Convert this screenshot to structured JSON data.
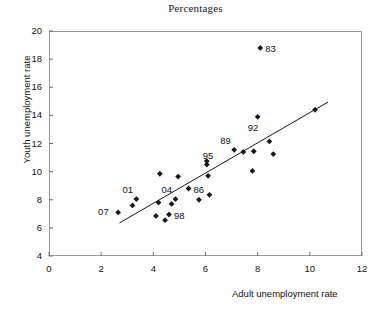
{
  "chart_data": {
    "type": "scatter",
    "title": "Percentages",
    "xlabel": "Adult unemployment rate",
    "ylabel": "Youth unemployment rate",
    "xlim": [
      0,
      12
    ],
    "ylim": [
      4,
      20
    ],
    "xticks": [
      0,
      2,
      4,
      6,
      8,
      10,
      12
    ],
    "yticks": [
      4,
      6,
      8,
      10,
      12,
      14,
      16,
      18,
      20
    ],
    "grid": false,
    "legend": "none",
    "marker": "filled-diamond",
    "marker_color": "#1a1a1a",
    "points": [
      {
        "x": 2.65,
        "y": 7.1,
        "label": "07",
        "label_pos": "left"
      },
      {
        "x": 3.2,
        "y": 7.6,
        "label": "",
        "label_pos": ""
      },
      {
        "x": 3.35,
        "y": 8.05,
        "label": "01",
        "label_pos": "above-left"
      },
      {
        "x": 4.1,
        "y": 6.85,
        "label": "",
        "label_pos": ""
      },
      {
        "x": 4.2,
        "y": 7.8,
        "label": "",
        "label_pos": ""
      },
      {
        "x": 4.25,
        "y": 9.85,
        "label": "",
        "label_pos": ""
      },
      {
        "x": 4.45,
        "y": 6.55,
        "label": "",
        "label_pos": ""
      },
      {
        "x": 4.6,
        "y": 6.95,
        "label": "98",
        "label_pos": "right"
      },
      {
        "x": 4.7,
        "y": 7.7,
        "label": "",
        "label_pos": ""
      },
      {
        "x": 4.85,
        "y": 8.05,
        "label": "04",
        "label_pos": "above-left"
      },
      {
        "x": 4.95,
        "y": 9.65,
        "label": "",
        "label_pos": ""
      },
      {
        "x": 5.35,
        "y": 8.8,
        "label": "86",
        "label_pos": "right"
      },
      {
        "x": 5.75,
        "y": 8.0,
        "label": "",
        "label_pos": ""
      },
      {
        "x": 6.05,
        "y": 10.5,
        "label": "95",
        "label_pos": "above"
      },
      {
        "x": 6.05,
        "y": 10.75,
        "label": "",
        "label_pos": ""
      },
      {
        "x": 6.1,
        "y": 9.7,
        "label": "",
        "label_pos": ""
      },
      {
        "x": 6.15,
        "y": 8.35,
        "label": "",
        "label_pos": ""
      },
      {
        "x": 7.1,
        "y": 11.55,
        "label": "89",
        "label_pos": "above-left"
      },
      {
        "x": 7.45,
        "y": 11.4,
        "label": "",
        "label_pos": ""
      },
      {
        "x": 7.8,
        "y": 10.05,
        "label": "",
        "label_pos": ""
      },
      {
        "x": 7.85,
        "y": 11.45,
        "label": "",
        "label_pos": ""
      },
      {
        "x": 8.0,
        "y": 13.9,
        "label": "92",
        "label_pos": "below-left"
      },
      {
        "x": 8.1,
        "y": 18.8,
        "label": "83",
        "label_pos": "right"
      },
      {
        "x": 8.45,
        "y": 12.15,
        "label": "",
        "label_pos": ""
      },
      {
        "x": 8.6,
        "y": 11.25,
        "label": "",
        "label_pos": ""
      },
      {
        "x": 10.2,
        "y": 14.4,
        "label": "",
        "label_pos": ""
      }
    ],
    "trendline": {
      "x0": 2.7,
      "y0": 6.35,
      "x1": 10.7,
      "y1": 14.95
    }
  }
}
